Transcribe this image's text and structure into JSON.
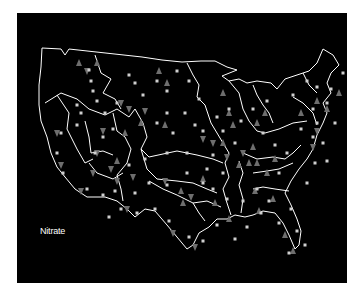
{
  "map": {
    "title": "Nitrate",
    "background": "#000000",
    "outline_color": "#ffffff",
    "legend_symbols": {
      "square": {
        "meaning": "site",
        "color": "#cfcfcf"
      },
      "triangle-up": {
        "color": "#6e6e6e"
      },
      "triangle-down": {
        "color": "#6e6e6e"
      }
    },
    "markers": {
      "squares": [
        [
          72,
          57
        ],
        [
          74,
          68
        ],
        [
          76,
          78
        ],
        [
          80,
          88
        ],
        [
          112,
          62
        ],
        [
          118,
          70
        ],
        [
          126,
          82
        ],
        [
          140,
          68
        ],
        [
          150,
          78
        ],
        [
          160,
          58
        ],
        [
          172,
          68
        ],
        [
          182,
          86
        ],
        [
          168,
          100
        ],
        [
          178,
          112
        ],
        [
          186,
          118
        ],
        [
          200,
          104
        ],
        [
          206,
          118
        ],
        [
          212,
          96
        ],
        [
          218,
          130
        ],
        [
          196,
          142
        ],
        [
          170,
          140
        ],
        [
          150,
          140
        ],
        [
          128,
          146
        ],
        [
          112,
          152
        ],
        [
          96,
          116
        ],
        [
          86,
          124
        ],
        [
          78,
          140
        ],
        [
          60,
          112
        ],
        [
          44,
          120
        ],
        [
          40,
          140
        ],
        [
          46,
          160
        ],
        [
          70,
          176
        ],
        [
          86,
          182
        ],
        [
          98,
          178
        ],
        [
          118,
          180
        ],
        [
          132,
          170
        ],
        [
          150,
          172
        ],
        [
          170,
          160
        ],
        [
          186,
          170
        ],
        [
          196,
          176
        ],
        [
          210,
          186
        ],
        [
          226,
          188
        ],
        [
          240,
          176
        ],
        [
          252,
          188
        ],
        [
          262,
          160
        ],
        [
          270,
          140
        ],
        [
          284,
          116
        ],
        [
          296,
          96
        ],
        [
          310,
          90
        ],
        [
          318,
          110
        ],
        [
          306,
          130
        ],
        [
          298,
          150
        ],
        [
          290,
          170
        ],
        [
          274,
          196
        ],
        [
          262,
          210
        ],
        [
          244,
          200
        ],
        [
          230,
          214
        ],
        [
          218,
          226
        ],
        [
          200,
          212
        ],
        [
          186,
          228
        ],
        [
          172,
          224
        ],
        [
          152,
          208
        ],
        [
          138,
          196
        ],
        [
          120,
          200
        ],
        [
          104,
          196
        ],
        [
          92,
          204
        ],
        [
          250,
          88
        ],
        [
          236,
          96
        ],
        [
          224,
          108
        ],
        [
          246,
          120
        ],
        [
          258,
          132
        ],
        [
          276,
          82
        ],
        [
          290,
          68
        ],
        [
          300,
          74
        ],
        [
          314,
          76
        ],
        [
          326,
          60
        ],
        [
          300,
          110
        ],
        [
          296,
          124
        ],
        [
          310,
          148
        ],
        [
          280,
          218
        ],
        [
          288,
          232
        ],
        [
          272,
          240
        ],
        [
          60,
          92
        ],
        [
          64,
          100
        ],
        [
          88,
          100
        ],
        [
          100,
          90
        ],
        [
          140,
          110
        ],
        [
          156,
          120
        ],
        [
          150,
          100
        ],
        [
          206,
          160
        ],
        [
          190,
          156
        ]
      ],
      "triangles_up": [
        [
          62,
          50
        ],
        [
          80,
          50
        ],
        [
          142,
          58
        ],
        [
          150,
          70
        ],
        [
          124,
          110
        ],
        [
          148,
          112
        ],
        [
          206,
          80
        ],
        [
          212,
          100
        ],
        [
          216,
          112
        ],
        [
          206,
          130
        ],
        [
          236,
          134
        ],
        [
          240,
          150
        ],
        [
          258,
          146
        ],
        [
          250,
          160
        ],
        [
          232,
          150
        ],
        [
          222,
          152
        ],
        [
          186,
          166
        ],
        [
          164,
          178
        ],
        [
          166,
          190
        ],
        [
          198,
          190
        ],
        [
          212,
          206
        ],
        [
          238,
          178
        ],
        [
          242,
          198
        ],
        [
          256,
          186
        ],
        [
          284,
          100
        ],
        [
          300,
          88
        ],
        [
          310,
          96
        ],
        [
          322,
          80
        ],
        [
          108,
          120
        ],
        [
          100,
          148
        ],
        [
          240,
          110
        ],
        [
          248,
          100
        ],
        [
          268,
          222
        ],
        [
          276,
          238
        ]
      ],
      "triangles_down": [
        [
          70,
          58
        ],
        [
          104,
          90
        ],
        [
          112,
          96
        ],
        [
          128,
          98
        ],
        [
          86,
          118
        ],
        [
          80,
          140
        ],
        [
          76,
          160
        ],
        [
          94,
          156
        ],
        [
          100,
          168
        ],
        [
          116,
          164
        ],
        [
          148,
          168
        ],
        [
          174,
          184
        ],
        [
          156,
          220
        ],
        [
          178,
          234
        ],
        [
          226,
          140
        ],
        [
          196,
          130
        ],
        [
          186,
          126
        ],
        [
          210,
          144
        ],
        [
          40,
          120
        ],
        [
          44,
          152
        ],
        [
          64,
          178
        ],
        [
          110,
          196
        ],
        [
          300,
          118
        ],
        [
          296,
          134
        ]
      ]
    }
  }
}
